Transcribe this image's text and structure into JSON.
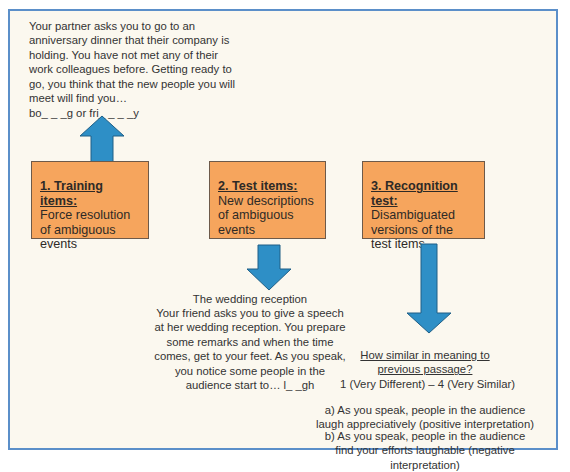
{
  "training_example": {
    "text": "Your partner asks you to go to an\nanniversary dinner that their company is\nholding. You have not met any of their\nwork colleagues before. Getting ready to\ngo, you think that the new people you will\nmeet will find you…",
    "fragment": "bo_ _ _g or fri_ _ _ _y"
  },
  "boxes": [
    {
      "title": "1. Training items:",
      "description": "Force resolution\nof ambiguous\nevents"
    },
    {
      "title": "2. Test items:",
      "description": "New descriptions\nof ambiguous\nevents"
    },
    {
      "title": "3. Recognition test:",
      "description": "Disambiguated\nversions of the\ntest items"
    }
  ],
  "test_example": {
    "title": "The wedding reception",
    "text": "Your friend asks you to give a speech\nat her wedding reception. You prepare\nsome remarks and when the time\ncomes, get to your feet. As you speak,\nyou notice some people in the\naudience start to… l_ _gh"
  },
  "recognition": {
    "question": "How similar in meaning to\nprevious passage?",
    "scale": "1 (Very Different) – 4 (Very Similar)",
    "options": [
      "a) As you speak, people in the audience\nlaugh appreciatively (positive interpretation)",
      "b) As you speak, people in the audience\nfind your efforts laughable (negative interpretation)"
    ]
  },
  "colors": {
    "frame_border": "#5b8fc9",
    "background": "#fbf8ef",
    "box_fill": "#f6a55d",
    "arrow_fill": "#2e8fc6",
    "arrow_stroke": "#1f5f86"
  },
  "icons": {
    "arrow_1": "arrow-up-icon",
    "arrow_2": "arrow-down-icon",
    "arrow_3": "arrow-down-long-icon"
  }
}
